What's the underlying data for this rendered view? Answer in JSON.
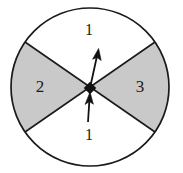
{
  "figure": {
    "name": "spinner-wheel",
    "background_color": "#ffffff"
  },
  "circle": {
    "center_x": 90,
    "center_y": 87,
    "radius": 79,
    "stroke_color": "#1a1a1a",
    "stroke_width": 1.6,
    "fill_color": "#ffffff"
  },
  "sectors": [
    {
      "id": "sector-top",
      "label": "",
      "fill_color": "#ffffff",
      "start_angle_deg": 35,
      "end_angle_deg": 145,
      "label_x": 90,
      "label_y": 42
    },
    {
      "id": "sector-left",
      "label": "2",
      "fill_color": "#c9c9c9",
      "start_angle_deg": 145,
      "end_angle_deg": 215,
      "label_x": 40,
      "label_y": 88
    },
    {
      "id": "sector-bottom",
      "label": "",
      "fill_color": "#ffffff",
      "start_angle_deg": 215,
      "end_angle_deg": 325,
      "label_x": 90,
      "label_y": 133
    },
    {
      "id": "sector-right",
      "label": "3",
      "fill_color": "#c9c9c9",
      "start_angle_deg": 325,
      "end_angle_deg": 35,
      "label_x": 140,
      "label_y": 88
    }
  ],
  "arrows": [
    {
      "id": "arrow-upper",
      "label": "1",
      "tail_x": 90,
      "tail_y": 88,
      "tip_x": 98,
      "tip_y": 50,
      "label_x": 89,
      "label_y": 31,
      "color": "#111111"
    },
    {
      "id": "arrow-lower",
      "label": "1",
      "tail_x": 88,
      "tail_y": 122,
      "tip_x": 90,
      "tip_y": 92,
      "label_x": 89,
      "label_y": 136,
      "color": "#111111"
    }
  ],
  "pivot": {
    "id": "spinner-pivot",
    "x": 90,
    "y": 88,
    "size": 8,
    "color": "#111111"
  }
}
